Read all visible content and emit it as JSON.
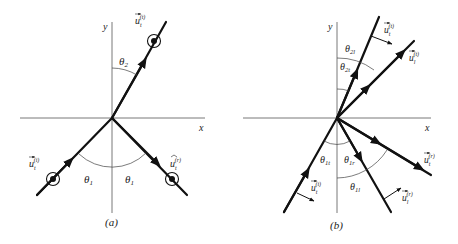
{
  "panel_a": {
    "caption": "(a)",
    "axis_x": "x",
    "axis_y": "y",
    "theta_2": "θ",
    "theta_2_sub": "2",
    "theta_1_left": "θ",
    "theta_1_left_sub": "1",
    "theta_1_right": "θ",
    "theta_1_right_sub": "1",
    "u_incident": "u",
    "u_incident_sub": "t",
    "u_incident_sup": "(i)",
    "u_reflected": "u",
    "u_reflected_sub": "t",
    "u_reflected_sup": "(r)",
    "u_transmitted": "u",
    "u_transmitted_sub": "t",
    "u_transmitted_sup": "(t)"
  },
  "panel_b": {
    "caption": "(b)",
    "axis_x": "x",
    "axis_y": "y",
    "theta_2l": "θ",
    "theta_2l_sub": "2l",
    "theta_2t": "θ",
    "theta_2t_sub": "2t",
    "theta_1t_left": "θ",
    "theta_1t_left_sub": "1t",
    "theta_1r": "θ",
    "theta_1r_sub": "1r",
    "theta_1l": "θ",
    "theta_1l_sub": "1l",
    "u_t_transmitted": "u",
    "u_t_transmitted_sub": "t",
    "u_t_transmitted_sup": "(t)",
    "u_l_transmitted": "u",
    "u_l_transmitted_sub": "l",
    "u_l_transmitted_sup": "(t)",
    "u_t_incident": "u",
    "u_t_incident_sub": "t",
    "u_t_incident_sup": "(i)",
    "u_l_reflected": "u",
    "u_l_reflected_sub": "l",
    "u_l_reflected_sup": "(r)",
    "u_t_reflected": "u",
    "u_t_reflected_sub": "t",
    "u_t_reflected_sup": "(r)"
  }
}
